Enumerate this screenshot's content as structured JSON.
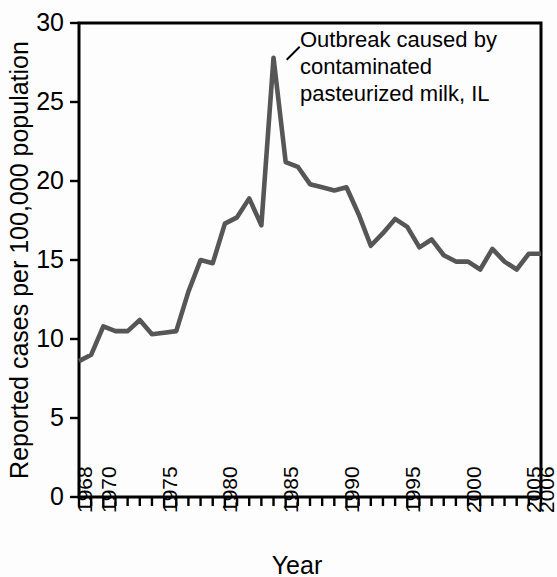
{
  "chart_data": {
    "type": "line",
    "title": "",
    "xlabel": "Year",
    "ylabel": "Reported cases per 100,000 population",
    "xlim": [
      1968,
      2006
    ],
    "ylim": [
      0,
      30
    ],
    "grid": false,
    "legend": null,
    "y_ticks": [
      0,
      5,
      10,
      15,
      20,
      25,
      30
    ],
    "y_tick_labels": [
      "0",
      "5",
      "10",
      "15",
      "20",
      "25",
      "30"
    ],
    "x_tick_labels": [
      "1968",
      "1970",
      "1975",
      "1980",
      "1985",
      "1990",
      "1995",
      "2000",
      "2005",
      "2006"
    ],
    "x_tick_label_years": [
      1968,
      1970,
      1975,
      1980,
      1985,
      1990,
      1995,
      2000,
      2005,
      2006
    ],
    "x_minor_ticks_every_year": true,
    "line_color": "#565656",
    "x": [
      1968,
      1969,
      1970,
      1971,
      1972,
      1973,
      1974,
      1975,
      1976,
      1977,
      1978,
      1979,
      1980,
      1981,
      1982,
      1983,
      1984,
      1985,
      1986,
      1987,
      1988,
      1989,
      1990,
      1991,
      1992,
      1993,
      1994,
      1995,
      1996,
      1997,
      1998,
      1999,
      2000,
      2001,
      2002,
      2003,
      2004,
      2005,
      2006
    ],
    "values": [
      8.6,
      9.0,
      10.8,
      10.5,
      10.5,
      11.2,
      10.3,
      10.4,
      10.5,
      13.0,
      15.0,
      14.8,
      17.3,
      17.7,
      18.9,
      17.2,
      27.8,
      21.2,
      20.9,
      19.8,
      19.6,
      19.4,
      19.6,
      17.9,
      15.9,
      16.7,
      17.6,
      17.1,
      15.8,
      16.3,
      15.3,
      14.9,
      14.9,
      14.4,
      15.7,
      14.9,
      14.4,
      15.4,
      15.4
    ],
    "annotations": [
      {
        "text_lines": [
          "Outbreak caused by",
          "contaminated",
          "pasteurized milk, IL"
        ],
        "points_to_year": 1985,
        "points_to_value": 27.8
      }
    ]
  },
  "axes": {
    "y_axis_title": "Reported cases per 100,000 population",
    "x_axis_title": "Year"
  },
  "annotation": {
    "line1": "Outbreak caused by",
    "line2": "contaminated",
    "line3": "pasteurized milk, IL"
  },
  "colors": {
    "line": "#565656",
    "axis": "#000000",
    "background": "#ffffff"
  }
}
